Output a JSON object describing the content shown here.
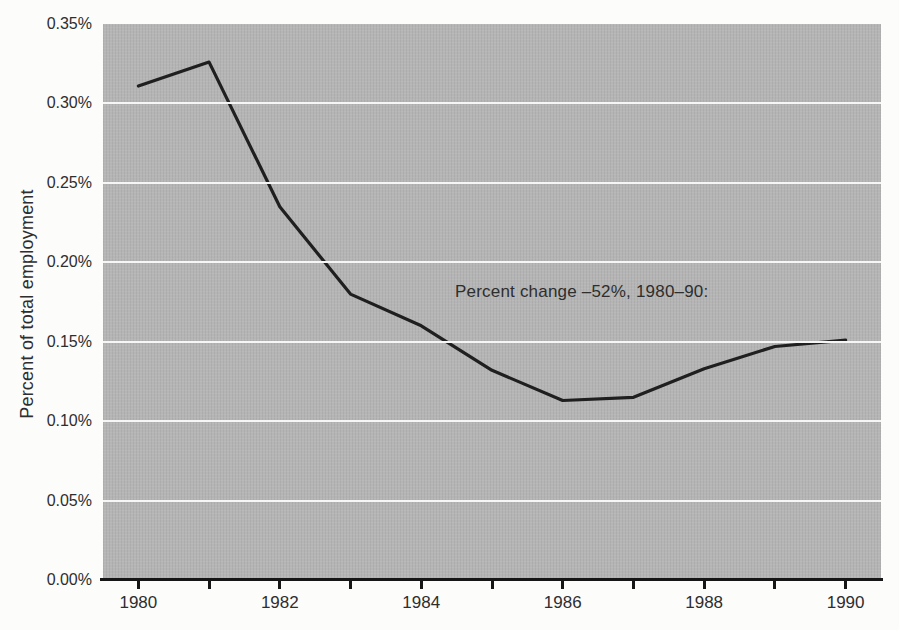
{
  "chart_data": {
    "type": "line",
    "title": "",
    "xlabel": "",
    "ylabel": "Percent of total employment",
    "annotation": "Percent change –52%, 1980–90:",
    "x": [
      1980,
      1981,
      1982,
      1983,
      1984,
      1985,
      1986,
      1987,
      1988,
      1989,
      1990
    ],
    "series": [
      {
        "name": "Percent of total employment",
        "values": [
          0.311,
          0.326,
          0.235,
          0.18,
          0.16,
          0.132,
          0.113,
          0.115,
          0.133,
          0.147,
          0.151
        ]
      }
    ],
    "xlim": [
      1979.5,
      1990.5
    ],
    "ylim": [
      0,
      0.35
    ],
    "y_units": "percent",
    "grid": "horizontal",
    "legend": "none",
    "grid_values": [
      0.05,
      0.1,
      0.15,
      0.2,
      0.25,
      0.3
    ],
    "yticks": [
      {
        "v": 0.0,
        "label": "0.00%"
      },
      {
        "v": 0.05,
        "label": "0.05%"
      },
      {
        "v": 0.1,
        "label": "0.10%"
      },
      {
        "v": 0.15,
        "label": "0.15%"
      },
      {
        "v": 0.2,
        "label": "0.20%"
      },
      {
        "v": 0.25,
        "label": "0.25%"
      },
      {
        "v": 0.3,
        "label": "0.30%"
      },
      {
        "v": 0.35,
        "label": "0.35%"
      }
    ],
    "xticks": [
      1980,
      1981,
      1982,
      1983,
      1984,
      1985,
      1986,
      1987,
      1988,
      1989,
      1990
    ],
    "xtick_labels": [
      {
        "v": 1980,
        "label": "1980"
      },
      {
        "v": 1982,
        "label": "1982"
      },
      {
        "v": 1984,
        "label": "1984"
      },
      {
        "v": 1986,
        "label": "1986"
      },
      {
        "v": 1988,
        "label": "1988"
      },
      {
        "v": 1990,
        "label": "1990"
      }
    ],
    "colors": {
      "plot_bg": "#b5b5b5",
      "line": "#1f1f1f",
      "gridline": "#f6f6f4",
      "axis": "#161616",
      "text": "#2e2e2e",
      "page_bg": "#fcfcfb"
    }
  }
}
